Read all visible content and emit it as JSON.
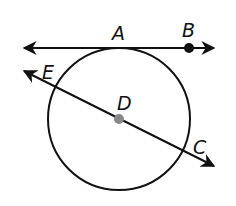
{
  "diagram": {
    "type": "circle-geometry",
    "circle": {
      "cx": 119,
      "cy": 119,
      "r": 71,
      "stroke": "#111111"
    },
    "tangent_line": {
      "x1": 24,
      "y1": 48,
      "x2": 214,
      "y2": 48,
      "through": [
        "A",
        "B"
      ]
    },
    "secant_line": {
      "x1": 24,
      "y1": 71,
      "x2": 214,
      "y2": 166,
      "through": [
        "E",
        "D",
        "C"
      ]
    },
    "points": {
      "A": {
        "label": "A",
        "x": 119,
        "y": 48
      },
      "B": {
        "label": "B",
        "x": 189,
        "y": 48,
        "dot_color": "#111111"
      },
      "C": {
        "label": "C",
        "x": 185,
        "y": 152
      },
      "D": {
        "label": "D",
        "x": 119,
        "y": 119,
        "dot_color": "#888888"
      },
      "E": {
        "label": "E",
        "x": 53,
        "y": 86
      }
    }
  }
}
